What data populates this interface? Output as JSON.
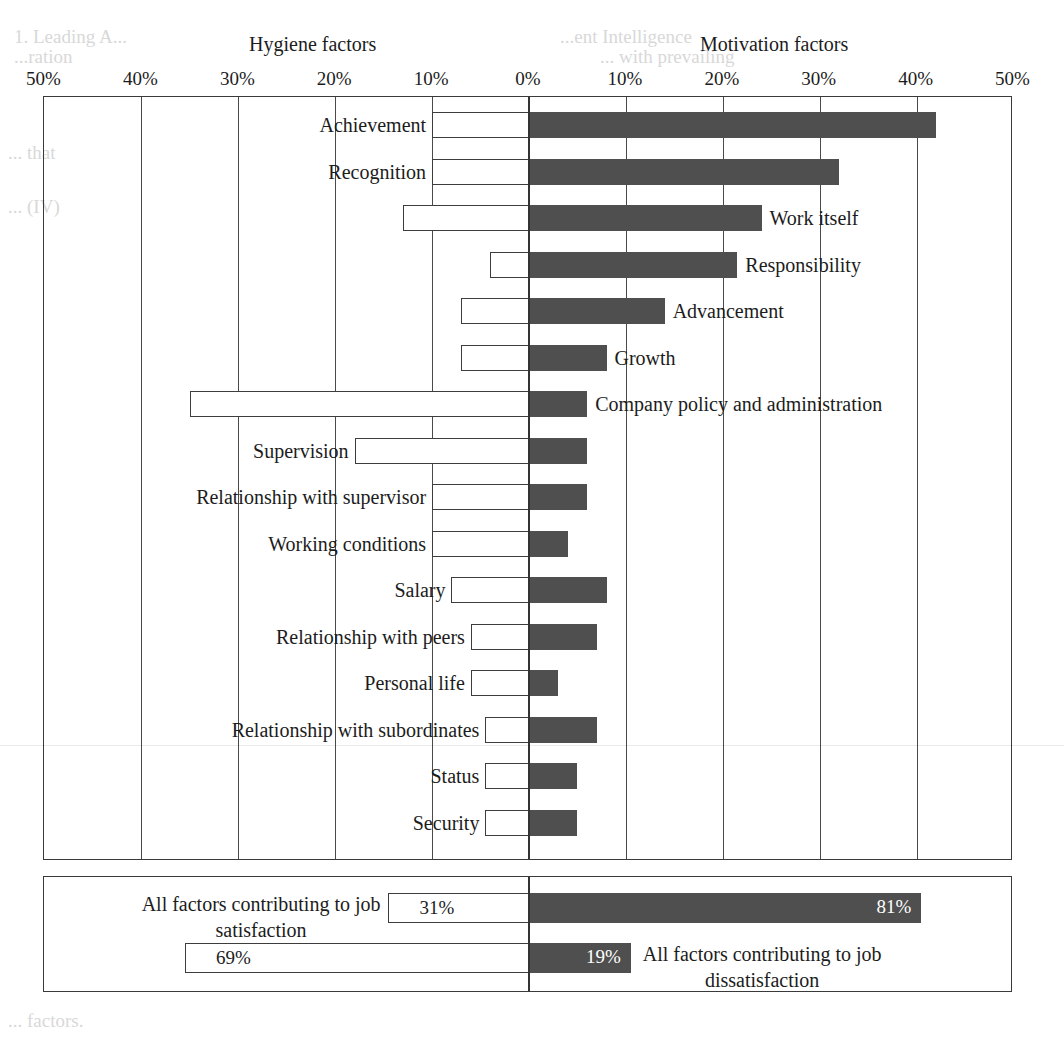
{
  "headers": {
    "left": "Hygiene factors",
    "right": "Motivation factors"
  },
  "axis": {
    "left_ticks": [
      "50%",
      "40%",
      "30%",
      "20%",
      "10%"
    ],
    "center_tick": "0%",
    "right_ticks": [
      "10%",
      "20%",
      "30%",
      "40%",
      "50%"
    ]
  },
  "bleed": {
    "a": "1. Leading A...",
    "b": "...ent Intelligence",
    "c": "...ration",
    "d": "... with prevailing",
    "e": "... that",
    "f": "... (IV)",
    "g": "... factors."
  },
  "chart_data": {
    "type": "bar",
    "orientation": "horizontal-diverging",
    "xlabel": "",
    "ylabel": "",
    "xlim": [
      -50,
      50
    ],
    "xticks": [
      -50,
      -40,
      -30,
      -20,
      -10,
      0,
      10,
      20,
      30,
      40,
      50
    ],
    "xtick_labels": [
      "50%",
      "40%",
      "30%",
      "20%",
      "10%",
      "0%",
      "10%",
      "20%",
      "30%",
      "40%",
      "50%"
    ],
    "grid": true,
    "legend": [
      "Hygiene factors",
      "Motivation factors"
    ],
    "series": [
      {
        "name": "Hygiene factors (dissatisfaction, left, white)",
        "color": "#ffffff"
      },
      {
        "name": "Motivation factors (satisfaction, right, dark)",
        "color": "#4f4f4f"
      }
    ],
    "categories": [
      "Achievement",
      "Recognition",
      "Work itself",
      "Responsibility",
      "Advancement",
      "Growth",
      "Company policy and administration",
      "Supervision",
      "Relationship with supervisor",
      "Working conditions",
      "Salary",
      "Relationship with peers",
      "Personal life",
      "Relationship with subordinates",
      "Status",
      "Security"
    ],
    "label_side": [
      "left",
      "left",
      "right",
      "right",
      "right",
      "right",
      "right",
      "left",
      "left",
      "left",
      "left",
      "left",
      "left",
      "left",
      "left",
      "left"
    ],
    "left_values": [
      10,
      10,
      13,
      4,
      7,
      7,
      35,
      18,
      10,
      10,
      8,
      6,
      6,
      4.5,
      4.5,
      4.5
    ],
    "right_values": [
      42,
      32,
      24,
      21.5,
      14,
      8,
      6,
      6,
      6,
      4,
      8,
      7,
      3,
      7,
      5,
      5
    ]
  },
  "summary": {
    "rows": [
      {
        "label": "All factors contributing to job satisfaction",
        "label_line1": "All factors contributing to job",
        "label_line2": "satisfaction",
        "label_side": "left",
        "left_value": 31,
        "left_value_label": "31%",
        "right_value": 81,
        "right_value_label": "81%"
      },
      {
        "label": "All factors contributing to job dissatisfaction",
        "label_line1": "All factors contributing to job",
        "label_line2": "dissatisfaction",
        "label_side": "right",
        "left_value": 69,
        "left_value_label": "69%",
        "right_value": 19,
        "right_value_label": "19%"
      }
    ]
  },
  "colors": {
    "bar_dark": "#4f4f4f",
    "bar_light": "#ffffff",
    "frame": "#3a3a3a",
    "grid": "#4a4a4a"
  }
}
